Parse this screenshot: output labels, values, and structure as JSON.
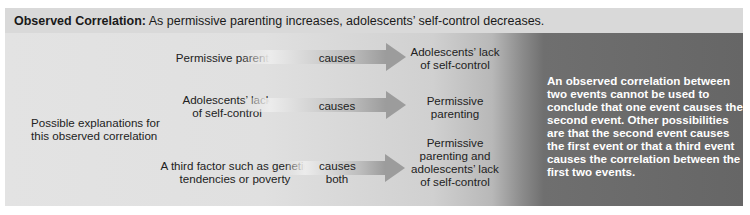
{
  "header": {
    "lead": "Observed Correlation:",
    "text": "As permissive parenting increases, adolescents’ self-control decreases."
  },
  "possible_label": "Possible explanations for this observed correlation",
  "explanations": [
    {
      "cause": "Permissive parenting",
      "verb": "causes",
      "effect": "Adolescents’ lack of self-control"
    },
    {
      "cause": "Adolescents’ lack of self-control",
      "verb": "causes",
      "effect": "Permissive parenting"
    },
    {
      "cause": "A third factor such as genetic tendencies or poverty",
      "verb": "causes both",
      "effect": "Permissive parenting and adolescents’ lack of self-control"
    }
  ],
  "note": "An observed correlation between two events cannot be used to conclude that one event causes the second event. Other possibilities are that the second event causes the first event or that a third event causes the correlation between the first two events.",
  "colors": {
    "header_bg": "#d9d9d9",
    "body_bg_light": "#e3e3e3",
    "body_bg_dark": "#666666",
    "arrow": "#9c9c9c",
    "note_text": "#ffffff"
  }
}
